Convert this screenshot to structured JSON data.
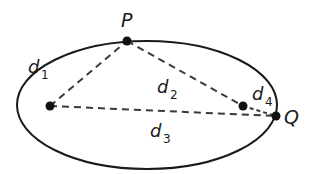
{
  "diagram": {
    "type": "ellipse-distances",
    "colors": {
      "stroke": "#1a1a1a",
      "background": "#ffffff"
    },
    "ellipse": {
      "cx": 147,
      "cy": 105,
      "rx": 130,
      "ry": 64
    },
    "points": {
      "P": {
        "x": 127,
        "y": 41,
        "label": "P"
      },
      "F1": {
        "x": 50,
        "y": 106
      },
      "F2": {
        "x": 243,
        "y": 106
      },
      "Q": {
        "x": 276,
        "y": 116,
        "label": "Q"
      }
    },
    "segments": [
      {
        "id": "d1",
        "from": "F1",
        "to": "P",
        "label": "d",
        "subscript": "1"
      },
      {
        "id": "d2",
        "from": "P",
        "to": "F2",
        "label": "d",
        "subscript": "2"
      },
      {
        "id": "d3",
        "from": "F1",
        "to": "Q",
        "label": "d",
        "subscript": "3"
      },
      {
        "id": "d4",
        "from": "F2",
        "to": "Q",
        "label": "d",
        "subscript": "4"
      }
    ]
  }
}
